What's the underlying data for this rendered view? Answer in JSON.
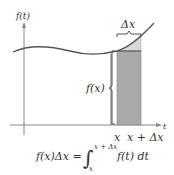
{
  "diagram": {
    "y_axis_label": "f(t)",
    "x_axis_label": "t",
    "delta_label": "Δx",
    "height_label": "f(x)",
    "x_tick_left": "x",
    "x_tick_right": "x + Δx",
    "formula_left": "f(x)Δx =",
    "integral_upper": "x + Δx",
    "integral_lower": "x",
    "integrand": "f(t) dt",
    "colors": {
      "curve": "#555555",
      "rect_dark": "#a9a9a9",
      "rect_light": "#d9d9d9",
      "axis": "#888888"
    }
  }
}
